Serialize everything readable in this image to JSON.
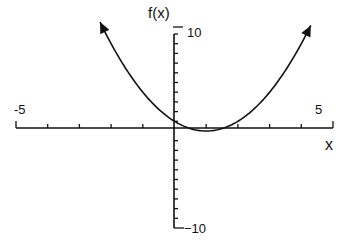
{
  "chart_data": {
    "type": "line",
    "title": "",
    "function": "f(x) = (x - 1)^2",
    "xlabel": "x",
    "ylabel": "f(x)",
    "xlim": [
      -5,
      5
    ],
    "ylim": [
      -10,
      10
    ],
    "x_tick_labels": [
      "-5",
      "5"
    ],
    "y_tick_labels": [
      "10",
      "-10"
    ],
    "x_ticks": [
      -5,
      -4,
      -3,
      -2,
      -1,
      0,
      1,
      2,
      3,
      4,
      5
    ],
    "y_ticks": [
      -10,
      -9,
      -8,
      -7,
      -6,
      -5,
      -4,
      -3,
      -2,
      -1,
      0,
      1,
      2,
      3,
      4,
      5,
      6,
      7,
      8,
      9,
      10
    ],
    "grid": false,
    "legend": null,
    "series": [
      {
        "name": "f(x)",
        "x": [
          -2.35,
          -2,
          -1.5,
          -1,
          -0.5,
          0,
          0.5,
          1,
          1.5,
          2,
          2.5,
          3,
          3.5,
          4,
          4.3
        ],
        "y": [
          11.2,
          9,
          6.25,
          4,
          2.25,
          1,
          0.25,
          0,
          0.25,
          1,
          2.25,
          4,
          6.25,
          9,
          10.9
        ],
        "arrows_at_ends": true
      }
    ],
    "annotations": {
      "vertex": [
        1,
        0
      ],
      "y_intercept": [
        0,
        1
      ]
    }
  },
  "labels": {
    "y_axis_label": "f(x)",
    "y_max": "10",
    "y_min": "−10",
    "x_min": "-5",
    "x_max": "5",
    "x_axis_label": "x"
  },
  "colors": {
    "ink": "#111111",
    "background": "#ffffff"
  }
}
